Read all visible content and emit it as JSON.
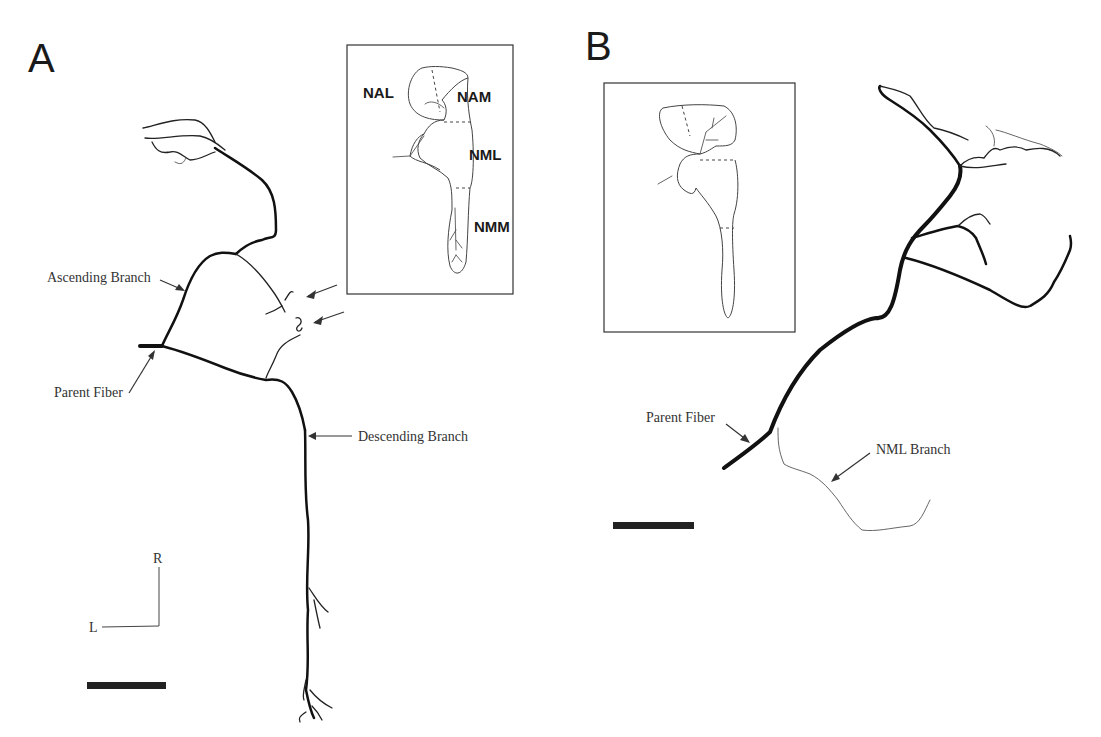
{
  "figure": {
    "panels": [
      {
        "id": "A",
        "letter": "A",
        "labels": {
          "ascending": "Ascending Branch",
          "parent": "Parent Fiber",
          "descending": "Descending Branch"
        },
        "inset": {
          "regions": [
            "NAL",
            "NAM",
            "NML",
            "NMM"
          ]
        },
        "orientation": {
          "vertical": "R",
          "horizontal": "L"
        },
        "annotation_arrows": 2
      },
      {
        "id": "B",
        "letter": "B",
        "labels": {
          "parent": "Parent Fiber",
          "nml_branch": "NML Branch"
        },
        "inset": {
          "regions": []
        }
      }
    ],
    "colors": {
      "ink": "#111111",
      "background": "#ffffff"
    }
  }
}
